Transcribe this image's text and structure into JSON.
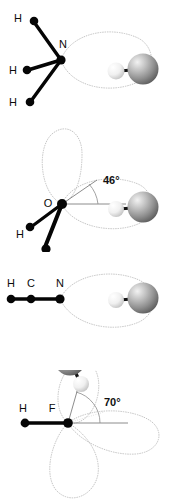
{
  "figure": {
    "background_color": "#ffffff",
    "width": 170,
    "height": 502,
    "panel_count": 4
  },
  "style": {
    "bond_color": "#050505",
    "label_color": "#0b0b0b",
    "lobe_color": "#b9b9b9",
    "ray_color": "#6f6f6f",
    "arc_color": "#8a8a8a",
    "sphere_large_color": "#8d8d8d",
    "sphere_small_color": "#efefef"
  },
  "panels": [
    {
      "id": "panel-ammonia",
      "molecule": "NH3",
      "central_atom": "N",
      "angle": null,
      "angle_label": "",
      "geometry": "pyramidal",
      "labels": [
        {
          "text": "H",
          "x": 20,
          "y": 18
        },
        {
          "text": "H",
          "x": 15,
          "y": 71
        },
        {
          "text": "H",
          "x": 15,
          "y": 103
        },
        {
          "text": "N",
          "x": 64,
          "y": 46
        }
      ],
      "lobes": 1,
      "probe": {
        "large": "large-sphere",
        "small": "small-sphere"
      }
    },
    {
      "id": "panel-water",
      "molecule": "H2O",
      "central_atom": "O",
      "angle": 46,
      "angle_label": "46°",
      "geometry": "bent",
      "labels": [
        {
          "text": "O",
          "x": 47,
          "y": 203
        },
        {
          "text": "H",
          "x": 22,
          "y": 235
        }
      ],
      "lobes": 1,
      "probe": {
        "large": "large-sphere",
        "small": "small-sphere"
      }
    },
    {
      "id": "panel-hydrogen-cyanide",
      "molecule": "HCN",
      "central_atom": "C",
      "angle": null,
      "angle_label": "",
      "geometry": "linear",
      "labels": [
        {
          "text": "H",
          "x": 9,
          "y": 283
        },
        {
          "text": "C",
          "x": 30,
          "y": 283
        },
        {
          "text": "N",
          "x": 57,
          "y": 283
        }
      ],
      "lobes": 0,
      "probe": {
        "large": "large-sphere",
        "small": "small-sphere"
      }
    },
    {
      "id": "panel-hydrogen-fluoride",
      "molecule": "HF",
      "central_atom": "F",
      "angle": 70,
      "angle_label": "70°",
      "geometry": "linear",
      "labels": [
        {
          "text": "H",
          "x": 18,
          "y": 421
        },
        {
          "text": "F",
          "x": 47,
          "y": 421
        }
      ],
      "lobes": 3,
      "probe": {
        "large": "large-sphere",
        "small": "small-sphere"
      }
    }
  ]
}
